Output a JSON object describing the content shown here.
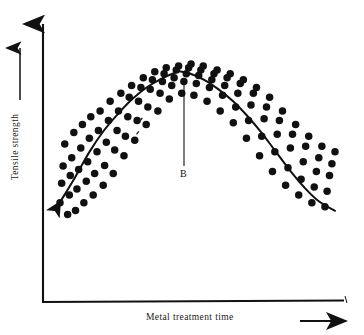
{
  "figure": {
    "type": "scientific-scatter-plot",
    "background_color": "#ffffff",
    "ink_color": "#111111"
  },
  "axes": {
    "y_label": "Tensile strength",
    "x_label": "Metal treatment time",
    "y_arrow_icon": "up-arrow-icon",
    "x_arrow_icon": "right-arrow-icon",
    "y_label_arrow_icon": "up-arrow-icon",
    "origin": [
      43,
      302
    ],
    "y_axis_top": [
      43,
      18
    ],
    "x_axis_right": [
      343,
      302
    ]
  },
  "annotations": [
    {
      "label": "B",
      "leader_line_from": [
        184,
        166
      ],
      "leader_line_to": [
        184,
        80
      ],
      "description": "vertical leader line from label B up to the peak of the trend curve"
    }
  ],
  "chart_data": {
    "type": "scatter",
    "title": "",
    "xlabel": "Metal treatment time",
    "ylabel": "Tensile strength",
    "xlim": [
      0,
      100
    ],
    "ylim": [
      0,
      100
    ],
    "grid": false,
    "legend": null,
    "axis_ticks": "none",
    "marker": {
      "shape": "circle",
      "color": "#111111",
      "size_px": 7.5
    },
    "series": [
      {
        "name": "Observations",
        "type": "scatter",
        "points": [
          [
            11.6,
            27.8
          ],
          [
            12.3,
            37.0
          ],
          [
            12.9,
            45.2
          ],
          [
            13.6,
            55.6
          ],
          [
            14.8,
            22.2
          ],
          [
            15.5,
            31.5
          ],
          [
            15.9,
            40.7
          ],
          [
            16.5,
            49.1
          ],
          [
            17.4,
            61.1
          ],
          [
            18.1,
            24.1
          ],
          [
            18.7,
            34.3
          ],
          [
            19.4,
            43.5
          ],
          [
            20.3,
            53.7
          ],
          [
            21.0,
            64.8
          ],
          [
            21.6,
            27.8
          ],
          [
            22.6,
            38.0
          ],
          [
            23.2,
            47.2
          ],
          [
            23.9,
            58.3
          ],
          [
            24.5,
            68.5
          ],
          [
            25.5,
            31.5
          ],
          [
            26.1,
            41.7
          ],
          [
            27.1,
            51.9
          ],
          [
            27.7,
            62.0
          ],
          [
            28.4,
            71.3
          ],
          [
            29.7,
            36.1
          ],
          [
            30.3,
            45.4
          ],
          [
            31.0,
            56.5
          ],
          [
            31.9,
            66.7
          ],
          [
            32.6,
            75.9
          ],
          [
            33.9,
            41.7
          ],
          [
            34.5,
            52.8
          ],
          [
            35.5,
            62.0
          ],
          [
            36.1,
            71.3
          ],
          [
            37.1,
            79.6
          ],
          [
            38.4,
            50.0
          ],
          [
            39.0,
            59.3
          ],
          [
            40.0,
            68.5
          ],
          [
            40.6,
            77.8
          ],
          [
            41.6,
            83.3
          ],
          [
            42.9,
            57.4
          ],
          [
            43.9,
            66.7
          ],
          [
            44.5,
            75.9
          ],
          [
            45.5,
            82.4
          ],
          [
            46.5,
            87.0
          ],
          [
            47.7,
            64.8
          ],
          [
            48.4,
            73.1
          ],
          [
            49.4,
            81.5
          ],
          [
            50.3,
            86.1
          ],
          [
            51.3,
            89.8
          ],
          [
            52.6,
            71.3
          ],
          [
            53.5,
            79.6
          ],
          [
            54.5,
            85.2
          ],
          [
            55.2,
            88.9
          ],
          [
            56.1,
            91.7
          ],
          [
            57.4,
            76.9
          ],
          [
            58.4,
            83.3
          ],
          [
            59.4,
            87.0
          ],
          [
            60.3,
            90.7
          ],
          [
            61.3,
            92.6
          ],
          [
            62.6,
            79.6
          ],
          [
            63.5,
            85.2
          ],
          [
            64.5,
            88.9
          ],
          [
            65.5,
            91.7
          ],
          [
            66.5,
            93.5
          ],
          [
            67.7,
            78.7
          ],
          [
            68.7,
            84.3
          ],
          [
            69.7,
            88.0
          ],
          [
            70.6,
            90.7
          ],
          [
            71.6,
            92.6
          ],
          [
            73.2,
            75.9
          ],
          [
            74.2,
            82.4
          ],
          [
            75.2,
            86.1
          ],
          [
            76.1,
            88.9
          ],
          [
            77.4,
            90.7
          ],
          [
            78.7,
            71.3
          ],
          [
            79.7,
            78.7
          ],
          [
            80.6,
            83.3
          ],
          [
            81.6,
            87.0
          ],
          [
            82.9,
            88.9
          ],
          [
            84.2,
            65.7
          ],
          [
            85.2,
            73.1
          ],
          [
            86.1,
            79.6
          ],
          [
            87.1,
            84.3
          ],
          [
            88.4,
            86.1
          ],
          [
            89.7,
            58.3
          ],
          [
            90.6,
            66.7
          ],
          [
            91.6,
            74.1
          ],
          [
            92.6,
            79.6
          ],
          [
            93.9,
            82.4
          ],
          [
            95.2,
            50.0
          ],
          [
            96.1,
            59.3
          ],
          [
            97.1,
            67.6
          ],
          [
            98.1,
            73.1
          ],
          [
            99.4,
            77.8
          ],
          [
            100.6,
            42.6
          ],
          [
            101.6,
            51.9
          ],
          [
            102.6,
            60.2
          ],
          [
            103.5,
            66.7
          ],
          [
            104.8,
            71.3
          ],
          [
            106.1,
            36.1
          ],
          [
            107.1,
            44.4
          ],
          [
            108.1,
            53.7
          ],
          [
            109.0,
            60.2
          ],
          [
            110.3,
            64.8
          ],
          [
            111.6,
            31.5
          ],
          [
            112.6,
            38.9
          ],
          [
            113.5,
            47.2
          ],
          [
            114.5,
            54.6
          ],
          [
            115.8,
            59.3
          ],
          [
            117.1,
            27.8
          ],
          [
            118.1,
            35.2
          ],
          [
            119.0,
            42.6
          ],
          [
            120.0,
            49.1
          ],
          [
            121.3,
            54.6
          ],
          [
            122.6,
            25.9
          ],
          [
            123.5,
            33.3
          ],
          [
            124.5,
            40.7
          ],
          [
            125.5,
            46.3
          ],
          [
            126.8,
            51.9
          ]
        ]
      },
      {
        "name": "Fitted trend curve",
        "type": "line",
        "shape": "inverted-U / concave-down parabola",
        "peak_at": [
          62.0,
          90.0
        ],
        "points": [
          [
            11.6,
            28.0
          ],
          [
            18.0,
            40.0
          ],
          [
            24.0,
            52.0
          ],
          [
            30.0,
            62.0
          ],
          [
            36.0,
            70.0
          ],
          [
            42.0,
            77.0
          ],
          [
            48.0,
            82.5
          ],
          [
            54.0,
            86.5
          ],
          [
            60.0,
            89.5
          ],
          [
            62.0,
            90.0
          ],
          [
            66.0,
            89.0
          ],
          [
            72.0,
            86.0
          ],
          [
            78.0,
            81.5
          ],
          [
            84.0,
            76.0
          ],
          [
            90.0,
            69.0
          ],
          [
            96.0,
            61.0
          ],
          [
            102.0,
            52.0
          ],
          [
            108.0,
            43.0
          ],
          [
            114.0,
            35.0
          ],
          [
            120.0,
            28.5
          ],
          [
            126.8,
            24.0
          ]
        ]
      }
    ]
  }
}
